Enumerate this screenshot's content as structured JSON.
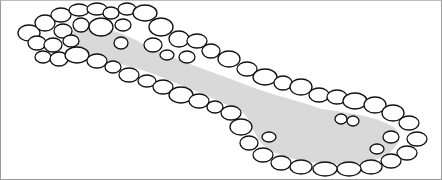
{
  "illustration": {
    "subject": "Line drawing of a stone-edged garden pond with a narrow stream connecting two pools",
    "colors": {
      "water": "#d9d9d9",
      "stone_fill": "#ffffff",
      "stone_outline": "#111111",
      "background": "#ffffff",
      "border": "#9a9a9a"
    }
  }
}
